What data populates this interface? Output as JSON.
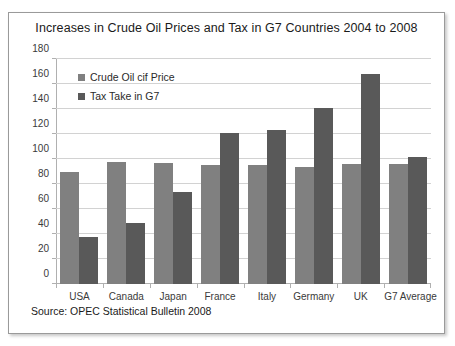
{
  "figure": {
    "source_note": "Source:  OPEC Statistical Bulletin 2008"
  },
  "chart_data": {
    "type": "bar",
    "title": "Increases in Crude Oil Prices and Tax in G7 Countries 2004 to 2008",
    "xlabel": "",
    "ylabel": "",
    "ylim": [
      0,
      180
    ],
    "ytick_step": 20,
    "yticks": [
      0,
      20,
      40,
      60,
      80,
      100,
      120,
      140,
      160,
      180
    ],
    "grid": "horizontal",
    "legend_position": "inside-top-left",
    "categories": [
      "USA",
      "Canada",
      "Japan",
      "France",
      "Italy",
      "Germany",
      "UK",
      "G7 Average"
    ],
    "series": [
      {
        "name": "Crude Oil cif Price",
        "color": "#808080",
        "values": [
          90,
          98,
          97,
          95,
          95,
          94,
          96,
          96
        ]
      },
      {
        "name": "Tax Take in G7",
        "color": "#595959",
        "values": [
          38,
          49,
          74,
          121,
          123,
          141,
          168,
          102
        ]
      }
    ]
  }
}
